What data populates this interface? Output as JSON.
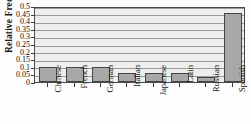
{
  "chart_data": {
    "type": "bar",
    "title": "",
    "xlabel": "",
    "ylabel": "Relative Frequency",
    "categories": [
      "Chinese",
      "French",
      "German",
      "Italian",
      "Japanese",
      "Latin",
      "Russian",
      "Spanish"
    ],
    "values": [
      0.1,
      0.1,
      0.1,
      0.06,
      0.06,
      0.06,
      0.03,
      0.455
    ],
    "ylim": [
      0,
      0.5
    ],
    "ytick_values": [
      0,
      0.05,
      0.1,
      0.15,
      0.2,
      0.25,
      0.3,
      0.35,
      0.4,
      0.45,
      0.5
    ],
    "ytick_labels": [
      "0",
      "0.05",
      "0.1",
      "0.15",
      "0.2",
      "0.25",
      "0.3",
      "0.35",
      "0.4",
      "0.45",
      "0.5"
    ],
    "grid": true,
    "legend": false,
    "legend_position": "none",
    "bar_color": "#a8a8a8",
    "bar_edge_color": "#454545",
    "plot_background": "#eeeeee",
    "gridline_color": "#9a9a9a",
    "axis_color": "#4a4a4a"
  }
}
